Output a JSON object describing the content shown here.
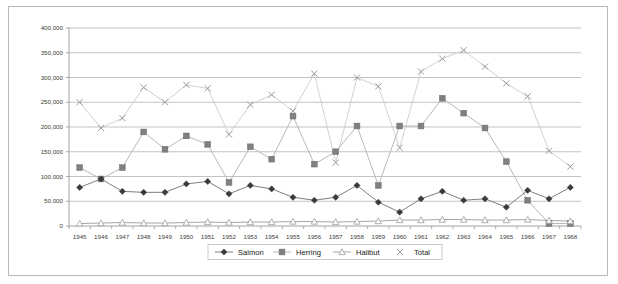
{
  "chart_data": {
    "type": "line",
    "title": "",
    "xlabel": "",
    "ylabel": "",
    "ylim": [
      0,
      400000
    ],
    "ytick_step": 50000,
    "grid": true,
    "legend_position": "bottom",
    "categories": [
      "1945",
      "1946",
      "1947",
      "1948",
      "1949",
      "1950",
      "1951",
      "1952",
      "1953",
      "1954",
      "1955",
      "1956",
      "1957",
      "1958",
      "1959",
      "1960",
      "1961",
      "1962",
      "1963",
      "1964",
      "1965",
      "1966",
      "1967",
      "1968"
    ],
    "ytick_labels": [
      "0",
      "50,000",
      "100,000",
      "150,000",
      "200,000",
      "250,000",
      "300,000",
      "350,000",
      "400,000"
    ],
    "ytick_values": [
      0,
      50000,
      100000,
      150000,
      200000,
      250000,
      300000,
      350000,
      400000
    ],
    "series": [
      {
        "name": "Salmon",
        "marker": "diamond",
        "color": "#3a3a3a",
        "line_color": "#6f6f6f",
        "values": [
          78000,
          95000,
          70000,
          68000,
          68000,
          85000,
          90000,
          65000,
          82000,
          75000,
          58000,
          52000,
          58000,
          82000,
          48000,
          28000,
          55000,
          70000,
          52000,
          55000,
          38000,
          72000,
          55000,
          78000
        ]
      },
      {
        "name": "Herring",
        "marker": "square",
        "color": "#808080",
        "line_color": "#b0b0b0",
        "values": [
          118000,
          95000,
          118000,
          190000,
          155000,
          182000,
          165000,
          88000,
          160000,
          135000,
          222000,
          125000,
          150000,
          202000,
          82000,
          202000,
          202000,
          258000,
          228000,
          198000,
          130000,
          52000,
          5000,
          5000
        ]
      },
      {
        "name": "Halibut",
        "marker": "triangle",
        "color": "#9a9a9a",
        "line_color": "#9a9a9a",
        "values": [
          5000,
          6000,
          7000,
          6000,
          6000,
          7000,
          8000,
          7000,
          8000,
          8000,
          9000,
          9000,
          8000,
          9000,
          10000,
          12000,
          12000,
          13000,
          13000,
          12000,
          12000,
          13000,
          11000,
          10000
        ]
      },
      {
        "name": "Total",
        "marker": "cross",
        "color": "#9a9a9a",
        "line_color": "#cccccc",
        "values": [
          250000,
          198000,
          218000,
          280000,
          250000,
          285000,
          278000,
          185000,
          245000,
          265000,
          232000,
          308000,
          128000,
          300000,
          282000,
          158000,
          312000,
          338000,
          355000,
          322000,
          288000,
          262000,
          152000,
          120000
        ]
      }
    ],
    "legend": [
      {
        "label": "Salmon",
        "marker": "diamond"
      },
      {
        "label": "Herring",
        "marker": "square"
      },
      {
        "label": "Halibut",
        "marker": "triangle"
      },
      {
        "label": "Total",
        "marker": "cross"
      }
    ]
  }
}
